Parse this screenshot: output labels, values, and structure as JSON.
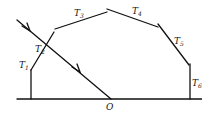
{
  "diagram": {
    "type": "ray-reflection-polygon",
    "segments": [
      {
        "label": "T",
        "sub": "1"
      },
      {
        "label": "T",
        "sub": "2"
      },
      {
        "label": "T",
        "sub": "3"
      },
      {
        "label": "T",
        "sub": "4"
      },
      {
        "label": "T",
        "sub": "5"
      },
      {
        "label": "T",
        "sub": "6"
      }
    ],
    "origin_label": "O",
    "colors": {
      "line": "#111111",
      "background": "#ffffff"
    }
  }
}
